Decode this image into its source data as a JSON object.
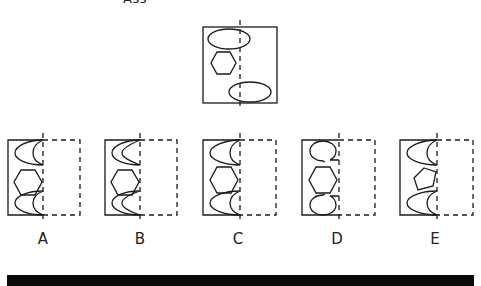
{
  "header": {
    "partial_text": "Ass"
  },
  "question_figure": {
    "description": "rectangle with dashed vertical axis; top ellipse, hexagon, bottom ellipse"
  },
  "options": [
    {
      "label": "A",
      "x": 43,
      "shape": "hexagon",
      "caps": "crescent"
    },
    {
      "label": "B",
      "x": 140,
      "shape": "hexagon",
      "caps": "thin-crescent"
    },
    {
      "label": "C",
      "x": 240,
      "shape": "hexagon",
      "caps": "crescent"
    },
    {
      "label": "D",
      "x": 339,
      "shape": "hexagon",
      "caps": "loop"
    },
    {
      "label": "E",
      "x": 437,
      "shape": "pentagon",
      "caps": "crescent"
    }
  ],
  "colors": {
    "stroke": "#1a1a1a",
    "background": "#ffffff",
    "bar": "#0a0a0a"
  }
}
